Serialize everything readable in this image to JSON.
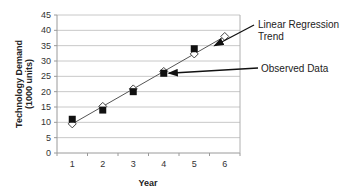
{
  "chart_data": {
    "type": "scatter",
    "title": "",
    "xlabel": "Year",
    "ylabel": "Technology Demand (1000 units)",
    "ylabel_lines": [
      "Technology Demand",
      "(1000 units)"
    ],
    "xlim": [
      0.5,
      6.5
    ],
    "ylim": [
      0,
      45
    ],
    "y_ticks": [
      0,
      5,
      10,
      15,
      20,
      25,
      30,
      35,
      40,
      45
    ],
    "x_ticks": [
      1,
      2,
      3,
      4,
      5,
      6
    ],
    "grid": true,
    "legend": null,
    "series": [
      {
        "name": "Observed Data",
        "marker": "filled-square",
        "color": "#111111",
        "x": [
          1,
          2,
          3,
          4,
          5
        ],
        "values": [
          11,
          14,
          20,
          26,
          34
        ]
      },
      {
        "name": "Linear Regression Trend",
        "marker": "hollow-diamond",
        "color": "#333333",
        "line": true,
        "x": [
          1,
          2,
          3,
          4,
          5,
          6
        ],
        "values": [
          9.5,
          15.2,
          20.9,
          26.6,
          32.3,
          38
        ]
      }
    ],
    "annotations": [
      {
        "text_lines": [
          "Linear Regression",
          "Trend"
        ],
        "points_to": {
          "x": 5.6,
          "y": 35.3
        }
      },
      {
        "text_lines": [
          "Observed Data"
        ],
        "points_to": {
          "x": 4,
          "y": 26
        }
      }
    ]
  }
}
